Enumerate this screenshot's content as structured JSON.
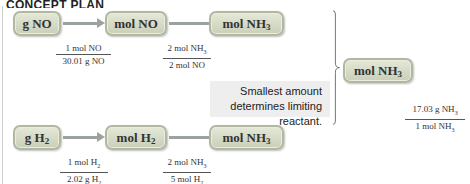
{
  "title": "CONCEPT PLAN",
  "path_no": {
    "boxes": [
      "g NO",
      "mol NO",
      "mol NH3"
    ],
    "conversions": [
      {
        "numerator": "1 mol NO",
        "denominator": "30.01 g NO"
      },
      {
        "numerator": "2 mol NH3",
        "denominator": "2 mol NO"
      }
    ]
  },
  "path_h2": {
    "boxes": [
      "g H2",
      "mol H2",
      "mol NH3"
    ],
    "conversions": [
      {
        "numerator": "1 mol H2",
        "denominator": "2.02 g H2"
      },
      {
        "numerator": "2 mol NH3",
        "denominator": "5 mol H2"
      }
    ]
  },
  "note": {
    "line1": "Smallest amount",
    "line2": "determines limiting reactant."
  },
  "final": {
    "boxes": [
      "mol NH3",
      "g NH3"
    ],
    "conversion": {
      "numerator": "17.03 g NH3",
      "denominator": "1 mol NH3"
    }
  },
  "colors": {
    "box_fill": "#d6dcc6",
    "box_border": "#b0b8a0",
    "arrow": "#9aa3a0",
    "note_bg": "#eeeeee"
  }
}
